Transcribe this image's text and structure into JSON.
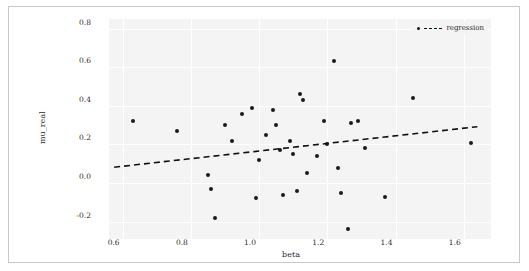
{
  "chart_data": {
    "type": "scatter",
    "title": "",
    "xlabel": "beta",
    "ylabel": "mu_real",
    "xlim": [
      0.56,
      1.68
    ],
    "ylim": [
      -0.29,
      0.85
    ],
    "xticks": [
      "0.6",
      "0.8",
      "1.0",
      "1.2",
      "1.4",
      "1.6"
    ],
    "xtick_values": [
      0.6,
      0.8,
      1.0,
      1.2,
      1.4,
      1.6
    ],
    "yticks": [
      "0.8",
      "0.6",
      "0.4",
      "0.2",
      "0.0",
      "-0.2"
    ],
    "ytick_values": [
      0.8,
      0.6,
      0.4,
      0.2,
      0.0,
      -0.2
    ],
    "grid": true,
    "legend_position": "upper right",
    "series": [
      {
        "name": "scatter",
        "marker": "circle",
        "color": "#1a1a1a",
        "points": [
          {
            "x": 0.63,
            "y": 0.32
          },
          {
            "x": 0.76,
            "y": 0.27
          },
          {
            "x": 0.85,
            "y": 0.04
          },
          {
            "x": 0.86,
            "y": -0.03
          },
          {
            "x": 0.87,
            "y": -0.18
          },
          {
            "x": 0.9,
            "y": 0.3
          },
          {
            "x": 0.92,
            "y": 0.22
          },
          {
            "x": 0.95,
            "y": 0.36
          },
          {
            "x": 0.98,
            "y": 0.39
          },
          {
            "x": 0.99,
            "y": -0.08
          },
          {
            "x": 1.0,
            "y": 0.12
          },
          {
            "x": 1.02,
            "y": 0.25
          },
          {
            "x": 1.04,
            "y": 0.38
          },
          {
            "x": 1.05,
            "y": 0.3
          },
          {
            "x": 1.06,
            "y": 0.17
          },
          {
            "x": 1.07,
            "y": -0.06
          },
          {
            "x": 1.09,
            "y": 0.22
          },
          {
            "x": 1.1,
            "y": 0.15
          },
          {
            "x": 1.11,
            "y": -0.04
          },
          {
            "x": 1.12,
            "y": 0.46
          },
          {
            "x": 1.13,
            "y": 0.43
          },
          {
            "x": 1.14,
            "y": 0.05
          },
          {
            "x": 1.17,
            "y": 0.14
          },
          {
            "x": 1.19,
            "y": 0.32
          },
          {
            "x": 1.2,
            "y": 0.2
          },
          {
            "x": 1.22,
            "y": 0.63
          },
          {
            "x": 1.23,
            "y": 0.08
          },
          {
            "x": 1.24,
            "y": -0.05
          },
          {
            "x": 1.26,
            "y": -0.24
          },
          {
            "x": 1.27,
            "y": 0.31
          },
          {
            "x": 1.29,
            "y": 0.32
          },
          {
            "x": 1.31,
            "y": 0.18
          },
          {
            "x": 1.37,
            "y": -0.07
          },
          {
            "x": 1.45,
            "y": 0.44
          },
          {
            "x": 1.62,
            "y": 0.21
          }
        ]
      }
    ],
    "regression": {
      "label": "regression",
      "style": "dashed",
      "color": "#111111",
      "endpoints": [
        {
          "x": 0.575,
          "y": 0.082
        },
        {
          "x": 1.64,
          "y": 0.292
        }
      ]
    }
  }
}
